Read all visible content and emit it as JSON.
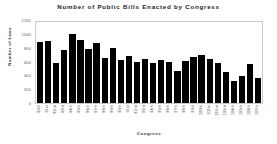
{
  "chart_data": {
    "type": "bar",
    "title": "Number of Public Bills Enacted by Congress",
    "xlabel": "Congress",
    "ylabel": "Number of Laws",
    "ylim": [
      0,
      1200
    ],
    "yticks": [
      1200,
      1000,
      800,
      600,
      400,
      200,
      0
    ],
    "grid": false,
    "legend": null,
    "bar_color": "#000000",
    "categories": [
      "80th",
      "81st",
      "82nd",
      "83rd",
      "84th",
      "85th",
      "86th",
      "87th",
      "88th",
      "89th",
      "90th",
      "91st",
      "92nd",
      "93rd",
      "94th",
      "95th",
      "96th",
      "97th",
      "98th",
      "99th",
      "100th",
      "101st",
      "102nd",
      "103rd",
      "104th",
      "105th",
      "106th",
      "107th"
    ],
    "values": [
      906,
      921,
      594,
      781,
      1028,
      936,
      800,
      885,
      666,
      810,
      640,
      695,
      607,
      649,
      588,
      633,
      613,
      473,
      623,
      677,
      713,
      650,
      590,
      465,
      333,
      394,
      580,
      377
    ]
  }
}
